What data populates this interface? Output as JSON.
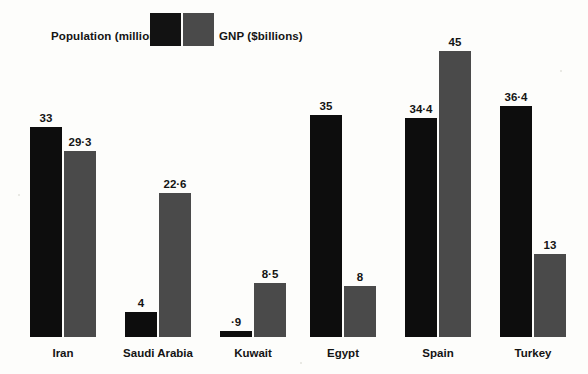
{
  "legend": {
    "population_label": "Population (millions)",
    "gnp_label": "GNP ($billions)",
    "population_color": "#0d0d0d",
    "gnp_color": "#4a4a4a"
  },
  "chart_data": {
    "type": "bar",
    "title": "",
    "subtitle": "",
    "xlabel": "",
    "ylabel": "",
    "ylim": [
      0,
      47
    ],
    "grid": false,
    "legend_position": "top-left",
    "categories": [
      "Iran",
      "Saudi Arabia",
      "Kuwait",
      "Egypt",
      "Spain",
      "Turkey"
    ],
    "series": [
      {
        "name": "Population (millions)",
        "color": "#0d0d0d",
        "values": [
          33,
          4,
          0.9,
          35,
          34.4,
          36.4
        ],
        "labels": [
          "33",
          "4",
          "·9",
          "35",
          "34·4",
          "36·4"
        ]
      },
      {
        "name": "GNP ($billions)",
        "color": "#4a4a4a",
        "values": [
          29.3,
          22.6,
          8.5,
          8,
          45,
          13
        ],
        "labels": [
          "29·3",
          "22·6",
          "8·5",
          "8",
          "45",
          "13"
        ]
      }
    ]
  }
}
